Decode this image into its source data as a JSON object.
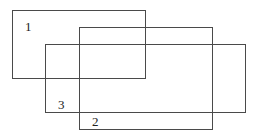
{
  "diagram": {
    "type": "overlapping-rectangles",
    "stroke_color": "#4a4a4a",
    "background": "#ffffff",
    "rectangles": [
      {
        "id": "1",
        "label": "1",
        "x": 12,
        "y": 10,
        "width": 134,
        "height": 69
      },
      {
        "id": "2",
        "label": "2",
        "x": 79,
        "y": 27,
        "width": 134,
        "height": 103
      },
      {
        "id": "3",
        "label": "3",
        "x": 45,
        "y": 44,
        "width": 201,
        "height": 69
      }
    ],
    "labels": [
      {
        "text": "1",
        "x": 25,
        "y": 20
      },
      {
        "text": "3",
        "x": 58,
        "y": 98
      },
      {
        "text": "2",
        "x": 92,
        "y": 115
      }
    ]
  }
}
